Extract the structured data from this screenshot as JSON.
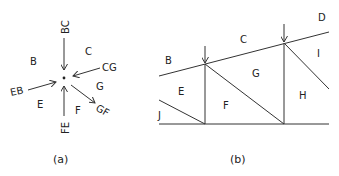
{
  "diagram_a": {
    "caption": "(a)",
    "region_labels": {
      "B": "B",
      "C": "C",
      "E": "E",
      "F": "F",
      "G": "G"
    },
    "force_labels": {
      "BC": "BC",
      "CG": "CG",
      "EB": "EB",
      "FE": "FE",
      "GF": "GF"
    }
  },
  "diagram_b": {
    "caption": "(b)",
    "region_labels": {
      "B": "B",
      "C": "C",
      "D": "D",
      "E": "E",
      "F": "F",
      "G": "G",
      "H": "H",
      "I": "I",
      "J": "J"
    }
  },
  "colors": {
    "line": "#333333",
    "text": "#222222",
    "background": "#ffffff"
  }
}
